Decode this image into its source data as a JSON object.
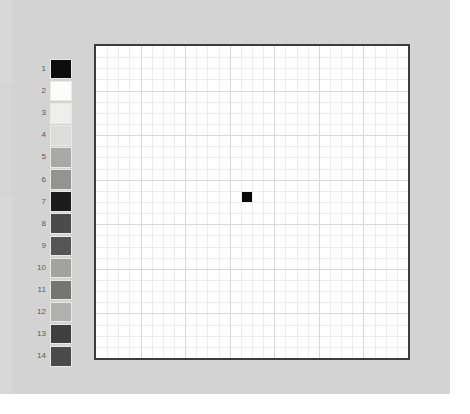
{
  "canvas": {
    "width": 470,
    "height": 414,
    "background": "#ffffff"
  },
  "panel": {
    "background": "#d3d3d3",
    "width": 450,
    "height": 394
  },
  "legend": {
    "name": "palette-legend",
    "item_count": 14,
    "items": [
      {
        "label": "1",
        "color": "#0d0d0d"
      },
      {
        "label": "2",
        "color": "#fcfcfa"
      },
      {
        "label": "3",
        "color": "#eeeeec"
      },
      {
        "label": "4",
        "color": "#dcdcda"
      },
      {
        "label": "5",
        "color": "#a8a8a6"
      },
      {
        "label": "6",
        "color": "#939391"
      },
      {
        "label": "7",
        "color": "#1b1b1b"
      },
      {
        "label": "8",
        "color": "#4b4b4b"
      },
      {
        "label": "9",
        "color": "#555555"
      },
      {
        "label": "10",
        "color": "#a2a2a0"
      },
      {
        "label": "11",
        "color": "#757573"
      },
      {
        "label": "12",
        "color": "#b0b0ae"
      },
      {
        "label": "13",
        "color": "#3f3f3f"
      },
      {
        "label": "14",
        "color": "#4a4a4a"
      }
    ]
  },
  "chart_data": {
    "type": "heatmap",
    "title": "",
    "xlabel": "",
    "ylabel": "",
    "grid": true,
    "legend_position": "left",
    "columns": 28,
    "rows": 28,
    "xlim": [
      0,
      28
    ],
    "ylim": [
      0,
      28
    ],
    "cell_size_px": 11.14,
    "plot_background": "#ffffff",
    "border_color": "#3c3c3c",
    "border_width": 2,
    "minor_grid_color": "#ececec",
    "major_grid_color": "#d8d8d8",
    "major_grid_every": 4,
    "categories": [],
    "values": [],
    "marked_cells": [
      {
        "col": 14,
        "row": 14,
        "color": "#0a0a0a",
        "label": "1"
      }
    ],
    "annotations": []
  }
}
